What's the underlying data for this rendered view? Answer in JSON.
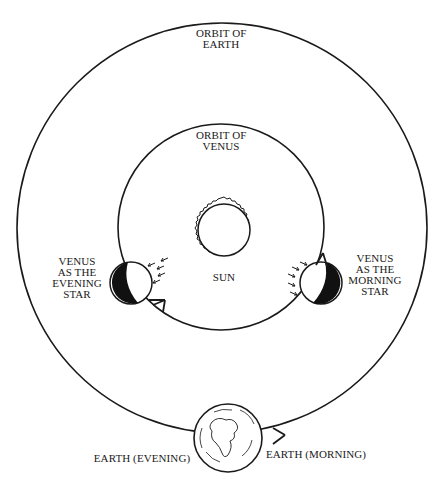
{
  "diagram": {
    "type": "orbital diagram",
    "colors": {
      "ink": "#1a1a1a",
      "background": "#ffffff"
    },
    "labels": {
      "orbit_earth": [
        "ORBIT OF",
        "EARTH"
      ],
      "orbit_venus": [
        "ORBIT OF",
        "VENUS"
      ],
      "sun": "SUN",
      "venus_evening": [
        "VENUS",
        "AS THE",
        "EVENING",
        "STAR"
      ],
      "venus_morning": [
        "VENUS",
        "AS THE",
        "MORNING",
        "STAR"
      ],
      "earth_evening": "EARTH (EVENING)",
      "earth_morning": "EARTH (MORNING)"
    },
    "elements": [
      {
        "name": "orbit-of-earth",
        "shape": "circle",
        "cx": 222,
        "cy": 228,
        "r": 205
      },
      {
        "name": "orbit-of-venus",
        "shape": "circle",
        "cx": 221,
        "cy": 227,
        "r": 103
      },
      {
        "name": "sun",
        "shape": "circle with corona",
        "cx": 224,
        "cy": 230,
        "r": 26
      },
      {
        "name": "venus-evening-star",
        "shape": "half-lit circle",
        "cx": 131,
        "cy": 283,
        "r": 21
      },
      {
        "name": "venus-morning-star",
        "shape": "half-lit circle",
        "cx": 321,
        "cy": 283,
        "r": 21
      },
      {
        "name": "earth",
        "shape": "globe",
        "cx": 228,
        "cy": 438,
        "r": 34
      }
    ],
    "arrows": [
      {
        "name": "venus-orbit-arrow-evening",
        "direction": "counterclockwise (down-right)"
      },
      {
        "name": "venus-orbit-arrow-morning",
        "direction": "up"
      },
      {
        "name": "earth-orbit-arrow",
        "direction": "right/up"
      }
    ]
  }
}
